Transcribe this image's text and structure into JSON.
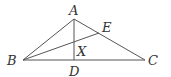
{
  "diagram": {
    "type": "geometry-triangle",
    "points": {
      "A": {
        "label": "A"
      },
      "B": {
        "label": "B"
      },
      "C": {
        "label": "C"
      },
      "D": {
        "label": "D"
      },
      "E": {
        "label": "E"
      },
      "X": {
        "label": "X"
      }
    },
    "segments": [
      {
        "from": "A",
        "to": "B"
      },
      {
        "from": "A",
        "to": "C"
      },
      {
        "from": "B",
        "to": "C"
      },
      {
        "from": "A",
        "to": "D"
      },
      {
        "from": "B",
        "to": "E"
      }
    ],
    "stroke_color": "#555555",
    "label_color": "#333333"
  }
}
